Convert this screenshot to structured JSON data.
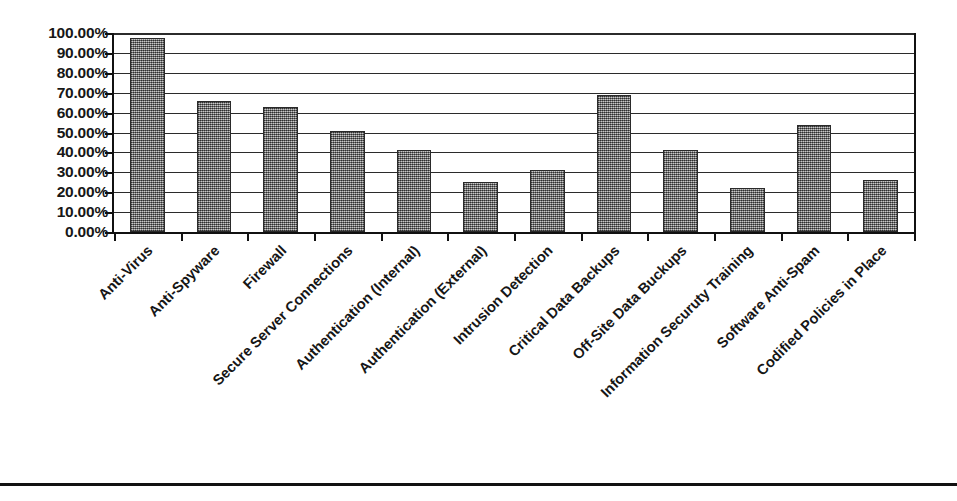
{
  "chart_data": {
    "type": "bar",
    "title": "",
    "subtitle": "",
    "xlabel": "",
    "ylabel": "",
    "ylim": [
      0,
      100
    ],
    "grid": true,
    "legend": false,
    "legend_position": "none",
    "orientation": "vertical",
    "value_suffix": "%",
    "categories": [
      "Anti-Virus",
      "Anti-Spyware",
      "Firewall",
      "Secure Server Connections",
      "Authentication (Internal)",
      "Authentication (External)",
      "Intrusion Detection",
      "Critical Data Backups",
      "Off-Site Data Buckups",
      "Information Securuty Training",
      "Software Anti-Spam",
      "Codified Policies in Place"
    ],
    "values": [
      97.5,
      66,
      63,
      51,
      41,
      25,
      31,
      69,
      41,
      22,
      54,
      26
    ],
    "value_labels": [
      "97.50%",
      "66.00%",
      "63.00%",
      "51.00%",
      "41.00%",
      "25.00%",
      "31.00%",
      "69.00%",
      "41.00%",
      "22.00%",
      "54.00%",
      "26.00%"
    ],
    "ytick_values": [
      0,
      10,
      20,
      30,
      40,
      50,
      60,
      70,
      80,
      90,
      100
    ],
    "ytick_labels": [
      "0.00%",
      "10.00%",
      "20.00%",
      "30.00%",
      "40.00%",
      "50.00%",
      "60.00%",
      "70.00%",
      "80.00%",
      "90.00%",
      "100.00%"
    ],
    "colors": {
      "bar_fill": "#8e8e8e",
      "bar_border": "#2a2a2a",
      "gridline": "#2b2b2b",
      "axis": "#111111",
      "text": "#161616",
      "background": "#ffffff"
    }
  }
}
